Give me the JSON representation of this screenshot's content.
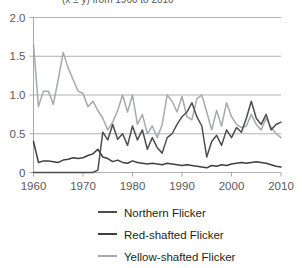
{
  "figure": {
    "title_partial": "(x ± y) from 1960 to 2010",
    "background": "#ffffff"
  },
  "chart_data": {
    "type": "line",
    "title": "",
    "xlabel": "",
    "ylabel": "",
    "xlim": [
      1960,
      2010
    ],
    "ylim": [
      0,
      2.0
    ],
    "grid": true,
    "grid_axis": "y",
    "legend_position": "bottom",
    "xticks": [
      1960,
      1970,
      1980,
      1990,
      2000,
      2010
    ],
    "xticklabels": [
      "1960",
      "1970",
      "1980",
      "1990",
      "2000",
      "2010"
    ],
    "yticks": [
      0,
      0.5,
      1.0,
      1.5,
      2.0
    ],
    "yticklabels": [
      "0",
      "0.5",
      "1.0",
      "1.5",
      "2.0"
    ],
    "x": [
      1960,
      1961,
      1962,
      1963,
      1964,
      1965,
      1966,
      1967,
      1968,
      1969,
      1970,
      1971,
      1972,
      1973,
      1974,
      1975,
      1976,
      1977,
      1978,
      1979,
      1980,
      1981,
      1982,
      1983,
      1984,
      1985,
      1986,
      1987,
      1988,
      1989,
      1990,
      1991,
      1992,
      1993,
      1994,
      1995,
      1996,
      1997,
      1998,
      1999,
      2000,
      2001,
      2002,
      2003,
      2004,
      2005,
      2006,
      2007,
      2008,
      2009,
      2010
    ],
    "series": [
      {
        "name": "Northern Flicker",
        "color": "#4d4d4f",
        "values": [
          0.0,
          0.0,
          0.0,
          0.0,
          0.0,
          0.0,
          0.0,
          0.0,
          0.0,
          0.0,
          0.0,
          0.0,
          0.0,
          0.03,
          0.52,
          0.42,
          0.62,
          0.43,
          0.5,
          0.35,
          0.6,
          0.42,
          0.55,
          0.3,
          0.45,
          0.32,
          0.25,
          0.45,
          0.5,
          0.62,
          0.72,
          0.78,
          0.9,
          0.72,
          0.6,
          0.2,
          0.4,
          0.48,
          0.35,
          0.55,
          0.45,
          0.58,
          0.52,
          0.7,
          0.92,
          0.7,
          0.62,
          0.75,
          0.55,
          0.62,
          0.65
        ]
      },
      {
        "name": "Red-shafted Flicker",
        "color": "#3f3f41",
        "values": [
          0.4,
          0.13,
          0.15,
          0.15,
          0.14,
          0.13,
          0.16,
          0.17,
          0.19,
          0.18,
          0.19,
          0.22,
          0.24,
          0.3,
          0.2,
          0.18,
          0.14,
          0.16,
          0.13,
          0.12,
          0.15,
          0.13,
          0.12,
          0.11,
          0.12,
          0.11,
          0.1,
          0.12,
          0.11,
          0.1,
          0.09,
          0.1,
          0.09,
          0.08,
          0.07,
          0.06,
          0.09,
          0.08,
          0.1,
          0.09,
          0.11,
          0.12,
          0.13,
          0.12,
          0.13,
          0.14,
          0.13,
          0.12,
          0.1,
          0.08,
          0.07
        ]
      },
      {
        "name": "Yellow-shafted Flicker",
        "color": "#a7a9ac",
        "values": [
          1.65,
          0.85,
          1.05,
          1.05,
          0.88,
          1.2,
          1.55,
          1.35,
          1.2,
          1.05,
          1.02,
          0.85,
          0.92,
          0.8,
          0.7,
          0.55,
          0.65,
          0.8,
          1.0,
          0.78,
          1.0,
          0.62,
          0.75,
          0.5,
          0.6,
          0.45,
          0.62,
          1.0,
          0.92,
          0.78,
          0.98,
          0.72,
          0.68,
          0.95,
          1.0,
          0.78,
          0.55,
          0.8,
          0.6,
          0.9,
          0.72,
          0.62,
          0.58,
          0.6,
          0.75,
          0.62,
          0.55,
          0.7,
          0.58,
          0.5,
          0.45
        ]
      }
    ]
  },
  "legend": {
    "items": [
      {
        "label": "Northern Flicker",
        "color": "#4d4d4f"
      },
      {
        "label": "Red-shafted Flicker",
        "color": "#3f3f41"
      },
      {
        "label": "Yellow-shafted Flicker",
        "color": "#a7a9ac"
      }
    ]
  }
}
